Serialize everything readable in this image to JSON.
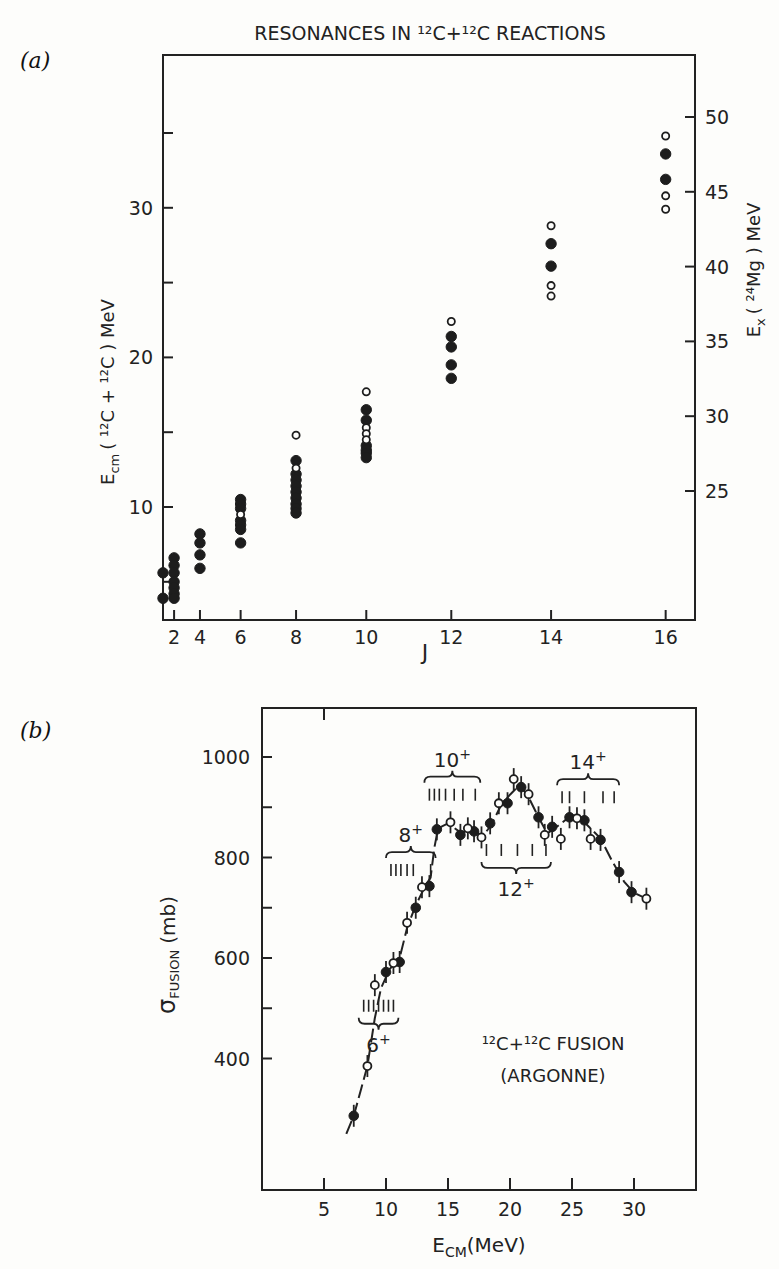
{
  "chart_data": [
    {
      "panel_label": "(a)",
      "type": "scatter",
      "title": "RESONANCES IN ¹²C+¹²C REACTIONS",
      "xlabel": "J",
      "xscale": "J(J+1)",
      "xticks": [
        2,
        4,
        6,
        8,
        10,
        12,
        14,
        16
      ],
      "ylabel": "E_cm (¹²C + ¹²C) MeV",
      "ylabel_parts": {
        "main": "E",
        "sub": "cm",
        "rest": "( ¹²C + ¹²C ) MeV"
      },
      "yticks": [
        5,
        10,
        15,
        20,
        25,
        30,
        35
      ],
      "ytick_labels": {
        "10": "10",
        "20": "20",
        "30": "30"
      },
      "ylim": [
        2.0,
        40.0
      ],
      "y2label": "E_x (²⁴Mg) MeV",
      "y2label_parts": {
        "main": "E",
        "sub": "x",
        "rest": "( ²⁴Mg ) MeV"
      },
      "y2_offset": 13.93,
      "y2ticks": [
        25,
        30,
        35,
        40,
        45,
        50
      ],
      "grid": false,
      "legend": "none",
      "series": [
        {
          "name": "filled",
          "marker": "filled-circle",
          "points": [
            [
              0,
              5.6
            ],
            [
              0,
              3.9
            ],
            [
              2,
              6.6
            ],
            [
              2,
              6.1
            ],
            [
              2,
              5.6
            ],
            [
              2,
              5.0
            ],
            [
              2,
              4.6
            ],
            [
              2,
              4.2
            ],
            [
              2,
              3.9
            ],
            [
              4,
              8.2
            ],
            [
              4,
              7.6
            ],
            [
              4,
              6.8
            ],
            [
              4,
              5.9
            ],
            [
              6,
              10.5
            ],
            [
              6,
              10.2
            ],
            [
              6,
              9.9
            ],
            [
              6,
              9.1
            ],
            [
              6,
              8.8
            ],
            [
              6,
              8.5
            ],
            [
              6,
              7.6
            ],
            [
              8,
              13.1
            ],
            [
              8,
              12.2
            ],
            [
              8,
              11.8
            ],
            [
              8,
              11.4
            ],
            [
              8,
              11.0
            ],
            [
              8,
              10.6
            ],
            [
              8,
              10.2
            ],
            [
              8,
              9.9
            ],
            [
              8,
              9.6
            ],
            [
              10,
              16.5
            ],
            [
              10,
              15.8
            ],
            [
              10,
              14.1
            ],
            [
              10,
              13.8
            ],
            [
              10,
              13.6
            ],
            [
              10,
              13.3
            ],
            [
              12,
              21.4
            ],
            [
              12,
              20.7
            ],
            [
              12,
              19.5
            ],
            [
              12,
              18.6
            ],
            [
              14,
              27.6
            ],
            [
              14,
              26.1
            ],
            [
              16,
              33.6
            ],
            [
              16,
              31.9
            ]
          ]
        },
        {
          "name": "open",
          "marker": "open-circle",
          "points": [
            [
              6,
              9.5
            ],
            [
              8,
              14.8
            ],
            [
              8,
              12.6
            ],
            [
              10,
              17.7
            ],
            [
              10,
              15.3
            ],
            [
              10,
              14.9
            ],
            [
              10,
              14.5
            ],
            [
              12,
              22.4
            ],
            [
              14,
              28.8
            ],
            [
              14,
              24.8
            ],
            [
              14,
              24.1
            ],
            [
              16,
              34.8
            ],
            [
              16,
              30.8
            ],
            [
              16,
              29.9
            ]
          ]
        }
      ]
    },
    {
      "panel_label": "(b)",
      "type": "scatter",
      "title": "",
      "xlabel": "E_CM (MeV)",
      "xlabel_parts": {
        "main": "E",
        "sub": "CM",
        "rest": "(MeV)"
      },
      "xticks": [
        5,
        10,
        15,
        20,
        25,
        30
      ],
      "xlim": [
        0,
        35
      ],
      "ylabel": "σ_FUSION (mb)",
      "ylabel_parts": {
        "main": "σ",
        "sub": "FUSION",
        "rest": "(mb)"
      },
      "yticks": [
        400,
        500,
        600,
        700,
        800,
        900,
        1000
      ],
      "ytick_labels": {
        "400": "400",
        "600": "600",
        "800": "800",
        "1000": "1000"
      },
      "ylim": [
        130,
        1100
      ],
      "grid": false,
      "annotation": {
        "line1": "¹²C+¹²C FUSION",
        "line2": "(ARGONNE)"
      },
      "series": [
        {
          "name": "filled",
          "marker": "filled-circle-errorbar",
          "points": [
            [
              7.4,
              286
            ],
            [
              10.0,
              572
            ],
            [
              11.1,
              592
            ],
            [
              12.4,
              700
            ],
            [
              13.5,
              743
            ],
            [
              14.1,
              856
            ],
            [
              16.0,
              845
            ],
            [
              17.1,
              852
            ],
            [
              18.4,
              868
            ],
            [
              19.8,
              908
            ],
            [
              20.9,
              940
            ],
            [
              22.3,
              880
            ],
            [
              23.4,
              861
            ],
            [
              24.8,
              880
            ],
            [
              26.0,
              874
            ],
            [
              27.3,
              835
            ],
            [
              28.8,
              771
            ],
            [
              29.8,
              731
            ]
          ]
        },
        {
          "name": "open",
          "marker": "open-circle-errorbar",
          "points": [
            [
              8.5,
              385
            ],
            [
              9.1,
              546
            ],
            [
              10.6,
              590
            ],
            [
              11.7,
              670
            ],
            [
              12.9,
              741
            ],
            [
              15.2,
              870
            ],
            [
              16.6,
              858
            ],
            [
              17.7,
              840
            ],
            [
              19.1,
              908
            ],
            [
              20.3,
              956
            ],
            [
              21.5,
              926
            ],
            [
              22.8,
              845
            ],
            [
              24.1,
              837
            ],
            [
              25.4,
              878
            ],
            [
              26.5,
              837
            ],
            [
              31.0,
              718
            ]
          ]
        },
        {
          "name": "fit-curve",
          "marker": "dashed-line",
          "points": [
            [
              6.8,
              250
            ],
            [
              7.4,
              286
            ],
            [
              8.0,
              340
            ],
            [
              8.5,
              385
            ],
            [
              9.1,
              480
            ],
            [
              9.6,
              540
            ],
            [
              10.3,
              578
            ],
            [
              11.1,
              600
            ],
            [
              11.7,
              660
            ],
            [
              12.4,
              705
            ],
            [
              13.2,
              745
            ],
            [
              13.6,
              760
            ],
            [
              13.9,
              820
            ],
            [
              14.2,
              858
            ],
            [
              15.0,
              868
            ],
            [
              16.0,
              850
            ],
            [
              17.0,
              855
            ],
            [
              17.8,
              842
            ],
            [
              18.5,
              865
            ],
            [
              19.3,
              905
            ],
            [
              20.0,
              925
            ],
            [
              20.8,
              945
            ],
            [
              21.5,
              920
            ],
            [
              22.3,
              880
            ],
            [
              23.0,
              848
            ],
            [
              23.6,
              858
            ],
            [
              24.5,
              875
            ],
            [
              25.5,
              880
            ],
            [
              26.2,
              865
            ],
            [
              27.3,
              838
            ],
            [
              28.3,
              790
            ],
            [
              29.2,
              752
            ],
            [
              30.0,
              730
            ],
            [
              31.0,
              718
            ]
          ]
        }
      ],
      "resonance_groups": [
        {
          "label": "6",
          "sup": "+",
          "ticks": [
            8.2,
            8.6,
            9.0,
            9.4,
            9.8,
            10.2,
            10.6
          ],
          "sigma_level": 505,
          "brace": "below"
        },
        {
          "label": "8",
          "sup": "+",
          "ticks": [
            10.4,
            10.8,
            11.2,
            11.7,
            12.2,
            13.6
          ],
          "sigma_level": 775,
          "brace": "above"
        },
        {
          "label": "10",
          "sup": "+",
          "ticks": [
            13.5,
            13.9,
            14.3,
            14.8,
            15.5,
            16.2,
            17.2
          ],
          "sigma_level": 925,
          "brace": "above"
        },
        {
          "label": "12",
          "sup": "+",
          "ticks": [
            18.1,
            19.3,
            20.6,
            21.8,
            22.9
          ],
          "sigma_level": 815,
          "brace": "below"
        },
        {
          "label": "14",
          "sup": "+",
          "ticks": [
            24.2,
            24.8,
            26.0,
            27.5,
            28.4
          ],
          "sigma_level": 920,
          "brace": "above"
        }
      ]
    }
  ]
}
